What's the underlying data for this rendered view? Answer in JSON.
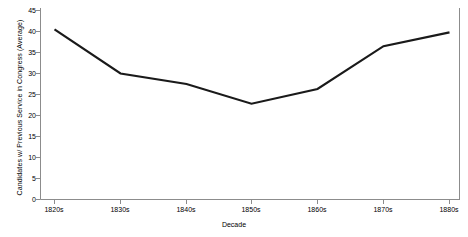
{
  "chart_data": {
    "type": "line",
    "title": "",
    "subtitle": "",
    "xlabel": "Decade",
    "ylabel": "Candidates w/ Previous Service in Congress (Average)",
    "categories": [
      "1820s",
      "1830s",
      "1840s",
      "1850s",
      "1860s",
      "1870s",
      "1880s"
    ],
    "values": [
      40.5,
      30.0,
      27.5,
      22.8,
      26.3,
      36.5,
      39.8
    ],
    "series": [
      {
        "name": "Candidates w/ Previous Service in Congress (Average)",
        "values": [
          40.5,
          30.0,
          27.5,
          22.8,
          26.3,
          36.5,
          39.8
        ]
      }
    ],
    "ylim": [
      0,
      45
    ],
    "yticks": [
      0,
      5,
      10,
      15,
      20,
      25,
      30,
      35,
      40,
      45
    ],
    "ytick_labels": [
      "0",
      "5",
      "10",
      "15",
      "20",
      "25",
      "30",
      "35",
      "40",
      "45"
    ],
    "xtick_labels": [
      "1820s",
      "1830s",
      "1840s",
      "1850s",
      "1860s",
      "1870s",
      "1880s"
    ],
    "grid": false,
    "legend": "none",
    "line_color": "#1a1a1a",
    "axis_color": "#8c8c8c",
    "background_color": "#ffffff"
  },
  "axes": {
    "y_title": "Candidates w/ Previous Service in Congress (Average)",
    "x_title": "Decade",
    "y_labels": [
      "45",
      "40",
      "35",
      "30",
      "25",
      "20",
      "15",
      "10",
      "5",
      "0"
    ],
    "x_labels": [
      "1820s",
      "1830s",
      "1840s",
      "1850s",
      "1860s",
      "1870s",
      "1880s"
    ]
  }
}
